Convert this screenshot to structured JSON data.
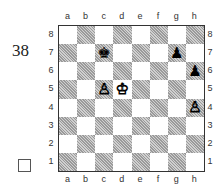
{
  "diagram": {
    "number": "38",
    "checkbox": "□",
    "files": [
      "a",
      "b",
      "c",
      "d",
      "e",
      "f",
      "g",
      "h"
    ],
    "ranks": [
      "8",
      "7",
      "6",
      "5",
      "4",
      "3",
      "2",
      "1"
    ],
    "pieces": [
      {
        "square": "c7",
        "piece": "king",
        "color": "black",
        "glyph": "♚"
      },
      {
        "square": "g7",
        "piece": "pawn",
        "color": "black",
        "glyph": "♟"
      },
      {
        "square": "h6",
        "piece": "pawn",
        "color": "black",
        "glyph": "♟"
      },
      {
        "square": "c5",
        "piece": "pawn",
        "color": "white",
        "glyph": "♙"
      },
      {
        "square": "d5",
        "piece": "king",
        "color": "white",
        "glyph": "♔"
      },
      {
        "square": "h4",
        "piece": "pawn",
        "color": "white",
        "glyph": "♙"
      }
    ]
  }
}
